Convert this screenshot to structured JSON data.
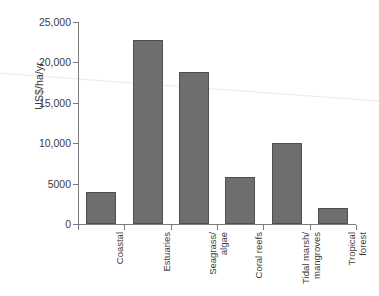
{
  "chart_data": {
    "type": "bar",
    "title": "",
    "subtitle": "",
    "xlabel": "",
    "ylabel": "US$/ha/yr",
    "ylim": [
      0,
      25000
    ],
    "ytick_labels": [
      "0",
      "5000",
      "10,000",
      "15,000",
      "20,000",
      "25,000"
    ],
    "ytick_values": [
      0,
      5000,
      10000,
      15000,
      20000,
      25000
    ],
    "grid": false,
    "legend": null,
    "categories": [
      "Coastal",
      "Estuaries",
      "Seagrass/\nalgae",
      "Coral reefs",
      "Tidal marsh/\nmangroves",
      "Tropical\nforest"
    ],
    "values": [
      4000,
      22800,
      18800,
      5800,
      10000,
      2000
    ],
    "bar_color": "#6e6e6e",
    "bar_edge_color": "#4f4f4f",
    "axis_color": "#7a7a7a",
    "text_color": "#3b3b3b",
    "annotations": []
  }
}
